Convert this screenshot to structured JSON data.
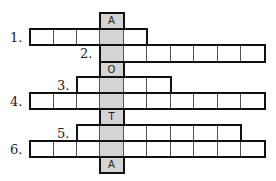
{
  "puzzle": {
    "type": "crossword",
    "key_column_letters": [
      {
        "row": 0,
        "letter": "A"
      },
      {
        "row": 3,
        "letter": "O"
      },
      {
        "row": 6,
        "letter": "T"
      },
      {
        "row": 9,
        "letter": "A"
      }
    ],
    "clue_numbers": [
      {
        "label": "1.",
        "row": 1
      },
      {
        "label": "2.",
        "row": 2
      },
      {
        "label": "3.",
        "row": 4
      },
      {
        "label": "4.",
        "row": 5
      },
      {
        "label": "5.",
        "row": 7
      },
      {
        "label": "6.",
        "row": 8
      }
    ],
    "rows": [
      {
        "id": "key-a-top",
        "start_col": 3,
        "end_col": 3
      },
      {
        "id": "row-1",
        "start_col": 0,
        "end_col": 4
      },
      {
        "id": "row-2",
        "start_col": 3,
        "end_col": 9
      },
      {
        "id": "key-o",
        "start_col": 3,
        "end_col": 3
      },
      {
        "id": "row-3",
        "start_col": 2,
        "end_col": 5
      },
      {
        "id": "row-4",
        "start_col": 0,
        "end_col": 9
      },
      {
        "id": "key-t",
        "start_col": 3,
        "end_col": 3
      },
      {
        "id": "row-5",
        "start_col": 2,
        "end_col": 8
      },
      {
        "id": "row-6",
        "start_col": 0,
        "end_col": 9
      },
      {
        "id": "key-a-bottom",
        "start_col": 3,
        "end_col": 3
      }
    ],
    "key_column": 3,
    "colors": {
      "shaded": "#d4d4d4",
      "border": "#111111",
      "line": "#555555"
    }
  }
}
